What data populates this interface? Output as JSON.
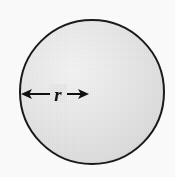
{
  "figure": {
    "background_color": "#fdfdfd",
    "shape": {
      "name": "circle",
      "fill_color": "#e2e2e2",
      "fill_highlight_color": "#f4f4f4",
      "fill_edge_color": "#cfcfcf",
      "outline_color": "#1a1a1a",
      "outline_width": 2,
      "center_x": 92,
      "center_y": 92,
      "radius": 72
    },
    "radius_arrow": {
      "label": "r",
      "color": "#101010",
      "start_x": 21,
      "end_x": 89,
      "y": 94,
      "line_width": 2,
      "head_length": 11,
      "head_half_width": 5,
      "label_x": 58,
      "label_y": 101,
      "double_headed": true
    }
  }
}
